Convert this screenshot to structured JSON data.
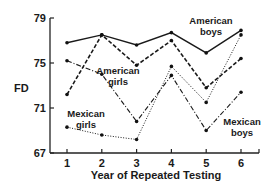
{
  "chart_data": {
    "type": "line",
    "title": "",
    "xlabel": "Year of Repeated Testing",
    "ylabel": "FD",
    "x": [
      1,
      2,
      3,
      4,
      5,
      6
    ],
    "xticks": [
      "1",
      "2",
      "3",
      "4",
      "5",
      "6"
    ],
    "yticks": [
      "67",
      "71",
      "75",
      "79"
    ],
    "ylim": [
      67,
      79
    ],
    "grid": false,
    "legend": "inline labels",
    "series": [
      {
        "name": "American boys",
        "style": "solid",
        "values": [
          76.8,
          77.5,
          76.6,
          77.7,
          75.9,
          77.9
        ],
        "label_lines": [
          "American",
          "boys"
        ]
      },
      {
        "name": "American girls",
        "style": "dashed",
        "values": [
          72.2,
          77.5,
          74.8,
          77.0,
          72.8,
          75.4
        ],
        "label_lines": [
          "American",
          "girls"
        ]
      },
      {
        "name": "Mexican boys",
        "style": "dash-dot",
        "values": [
          75.2,
          74.0,
          69.8,
          73.9,
          69.0,
          72.4
        ],
        "label_lines": [
          "Mexican",
          "boys"
        ]
      },
      {
        "name": "Mexican girls",
        "style": "dotted",
        "values": [
          69.3,
          68.6,
          68.2,
          74.7,
          71.5,
          77.5
        ],
        "label_lines": [
          "Mexican",
          "girls"
        ]
      }
    ]
  }
}
